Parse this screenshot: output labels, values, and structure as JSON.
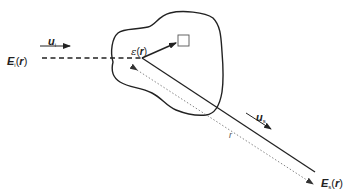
{
  "diagram": {
    "labels": {
      "incident_field": {
        "symbol": "E",
        "subscript": "i",
        "arg_open": "(",
        "arg": "r",
        "arg_close": ")"
      },
      "incident_direction": {
        "symbol": "u",
        "subscript": "i"
      },
      "permittivity": {
        "symbol": "ε",
        "arg_open": "(",
        "arg": "r",
        "arg_close": ")"
      },
      "scattered_direction": {
        "symbol": "u",
        "subscript": "s"
      },
      "distance": {
        "symbol": "r"
      },
      "scattered_field": {
        "symbol": "E",
        "subscript": "s",
        "arg_open": "(",
        "arg": "r",
        "arg_close": ")"
      }
    },
    "colors": {
      "stroke": "#222222",
      "dotted": "#888888",
      "background": "#ffffff"
    }
  }
}
